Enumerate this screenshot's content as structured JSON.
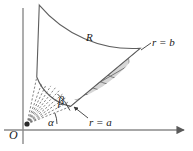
{
  "figure": {
    "colors": {
      "axis": "#8a8a8a",
      "grid_line": "#6e6e6e",
      "shade_fill": "#d6d6d6",
      "shade_stroke": "#9a9a9a",
      "label_text": "#1a1a1a",
      "background": "#ffffff",
      "origin_dot": "#2b2b2b"
    },
    "labels": {
      "origin": "O",
      "alpha": "α",
      "beta": "β",
      "region": "R",
      "inner_radius": "r = a",
      "outer_radius": "r = b"
    },
    "geometry": {
      "origin_x": 27,
      "origin_y": 124,
      "inner_radius_px": 47,
      "outer_radius_px": 122,
      "angle_alpha_deg": 22,
      "angle_beta_deg": 78,
      "radial_divisions": 7,
      "arc_divisions": 5,
      "dashed_rays": 9
    },
    "axes": {
      "x_axis_label": "",
      "y_axis_label": "",
      "x_axis_has_arrow": true,
      "y_axis_has_arrow": false
    }
  }
}
